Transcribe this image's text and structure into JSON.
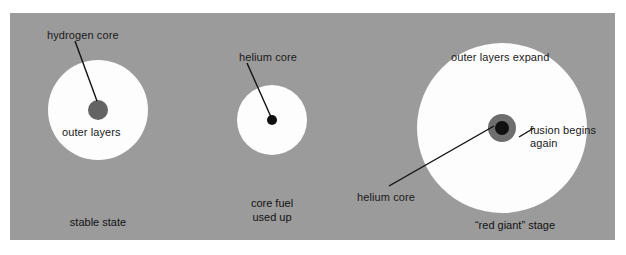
{
  "diagram": {
    "background_color": "#ffffff",
    "panel_color": "#9b9b9b",
    "star_color": "#fdfdfd",
    "text_color": "#1a1a1a",
    "leader_line_color": "#111111"
  },
  "stages": [
    {
      "id": "stable-state",
      "caption": "stable state",
      "star": {
        "cx": 98,
        "cy": 110,
        "r": 50,
        "color": "#fdfdfd"
      },
      "core": {
        "cx": 98,
        "cy": 110,
        "r": 10,
        "color": "#636363"
      },
      "labels": {
        "core_label": "hydrogen core",
        "envelope_label": "outer layers"
      }
    },
    {
      "id": "core-fuel-used-up",
      "caption": "core fuel\nused up",
      "star": {
        "cx": 272,
        "cy": 120,
        "r": 35,
        "color": "#fdfdfd"
      },
      "core": {
        "cx": 272,
        "cy": 120,
        "r": 5,
        "color": "#101010"
      },
      "labels": {
        "core_label": "helium core"
      }
    },
    {
      "id": "red-giant-stage",
      "caption": "“red giant” stage",
      "star": {
        "cx": 502,
        "cy": 128,
        "r": 85,
        "color": "#fdfdfd"
      },
      "core_shell": {
        "cx": 502,
        "cy": 128,
        "r": 14,
        "color": "#6e6e6e"
      },
      "core": {
        "cx": 502,
        "cy": 128,
        "r": 7,
        "color": "#101010"
      },
      "labels": {
        "envelope_label": "outer layers expand",
        "fusion_label": "fusion begins\nagain",
        "core_label": "helium core"
      }
    }
  ]
}
